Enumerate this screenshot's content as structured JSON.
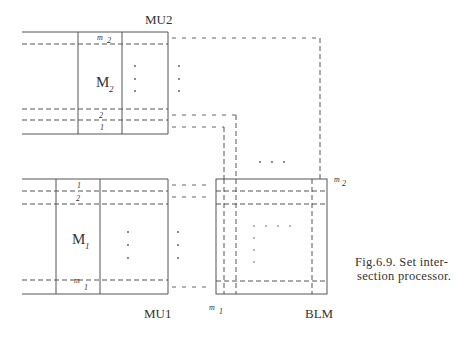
{
  "figure": {
    "caption_line1": "Fig.6.9. Set inter-",
    "caption_line2": "section processor.",
    "units": {
      "mu2": {
        "label": "MU2",
        "memory_label": "M",
        "memory_sub": "2",
        "rows": [
          "m",
          "2",
          "1"
        ],
        "row_m_sub": "2"
      },
      "mu1": {
        "label": "MU1",
        "memory_label": "M",
        "memory_sub": "1",
        "rows": [
          "1",
          "2",
          "m"
        ],
        "row_m_sub": "1"
      },
      "blm": {
        "label": "BLM",
        "dim_right": "m",
        "dim_right_sub": "2",
        "dim_bottom": "m",
        "dim_bottom_sub": "1"
      }
    },
    "ellipsis": "· · ·"
  }
}
